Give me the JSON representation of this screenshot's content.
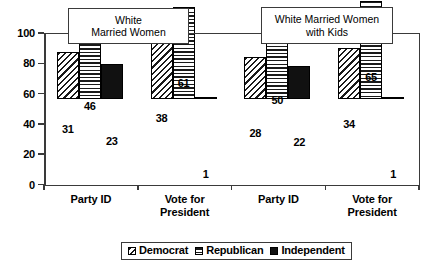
{
  "chart_data": {
    "type": "bar",
    "title": "",
    "xlabel": "",
    "ylabel": "",
    "ylim": [
      0,
      100
    ],
    "yticks": [
      "0",
      "20",
      "40",
      "60",
      "80",
      "100"
    ],
    "grid": false,
    "legend_position": "bottom",
    "categories": [
      "Party ID",
      "Vote for\nPresident",
      "Party ID",
      "Vote for\nPresident"
    ],
    "series": [
      {
        "name": "Democrat",
        "values": [
          31,
          38,
          28,
          34
        ]
      },
      {
        "name": "Republican",
        "values": [
          46,
          61,
          50,
          65
        ]
      },
      {
        "name": "Independent",
        "values": [
          23,
          1,
          22,
          1
        ]
      }
    ],
    "annotations": [
      {
        "name": "white-married-women",
        "text": "White\nMarried Women"
      },
      {
        "name": "white-married-women-with-kids",
        "text": "White Married Women\nwith Kids"
      }
    ]
  },
  "legend": {
    "items": [
      {
        "label": "Democrat",
        "pattern": "diagonal-hatch"
      },
      {
        "label": "Republican",
        "pattern": "horizontal-lines"
      },
      {
        "label": "Independent",
        "pattern": "solid-black"
      }
    ]
  },
  "colors": {
    "ink": "#000000",
    "axis": "#3a3a3a",
    "background": "#ffffff",
    "independent_fill": "#111111"
  }
}
